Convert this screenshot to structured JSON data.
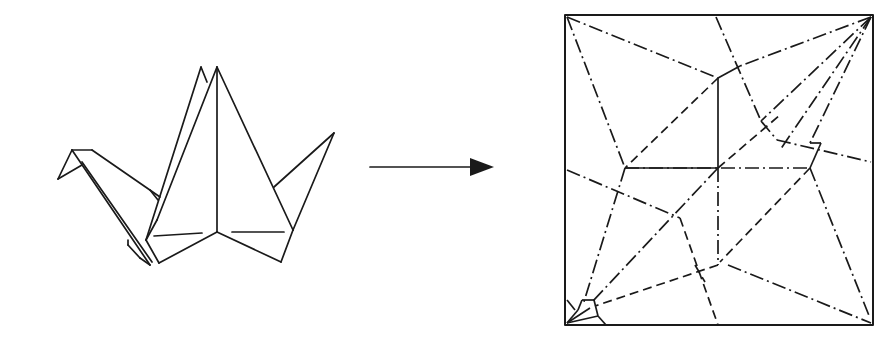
{
  "diagram": {
    "title": "Origami crane to crease pattern",
    "colors": {
      "ink": "#1a1a1a",
      "background": "#ffffff"
    },
    "crane": {
      "label": "Folded origami crane",
      "lines": [
        [
          [
            201,
            67
          ],
          [
            146,
            240
          ]
        ],
        [
          [
            201,
            67
          ],
          [
            207,
            82
          ]
        ],
        [
          [
            217,
            67
          ],
          [
            157,
            220
          ]
        ],
        [
          [
            217,
            67
          ],
          [
            217,
            232
          ]
        ],
        [
          [
            217,
            67
          ],
          [
            293,
            230
          ]
        ],
        [
          [
            217,
            232
          ],
          [
            159,
            263
          ]
        ],
        [
          [
            217,
            232
          ],
          [
            281,
            262
          ]
        ],
        [
          [
            157,
            220
          ],
          [
            146,
            240
          ]
        ],
        [
          [
            146,
            240
          ],
          [
            159,
            263
          ]
        ],
        [
          [
            281,
            262
          ],
          [
            293,
            230
          ]
        ],
        [
          [
            293,
            230
          ],
          [
            334,
            133
          ]
        ],
        [
          [
            334,
            133
          ],
          [
            274,
            187
          ]
        ],
        [
          [
            154,
            236
          ],
          [
            202,
            233
          ]
        ],
        [
          [
            232,
            232
          ],
          [
            284,
            232
          ]
        ],
        [
          [
            72,
            150
          ],
          [
            92,
            150
          ]
        ],
        [
          [
            92,
            150
          ],
          [
            160,
            197
          ]
        ],
        [
          [
            72,
            150
          ],
          [
            58,
            179
          ]
        ],
        [
          [
            58,
            179
          ],
          [
            82,
            165
          ]
        ],
        [
          [
            72,
            150
          ],
          [
            150,
            265
          ]
        ],
        [
          [
            82,
            162
          ],
          [
            152,
            262
          ]
        ],
        [
          [
            140,
            258
          ],
          [
            150,
            265
          ]
        ],
        [
          [
            128,
            240
          ],
          [
            128,
            245
          ]
        ],
        [
          [
            128,
            245
          ],
          [
            140,
            258
          ]
        ],
        [
          [
            150,
            190
          ],
          [
            158,
            200
          ]
        ]
      ]
    },
    "arrow": {
      "label": "transforms into",
      "x1": 370,
      "y1": 167,
      "x2": 470,
      "y2": 167,
      "head": [
        [
          470,
          158
        ],
        [
          494,
          167
        ],
        [
          470,
          176
        ]
      ]
    },
    "crease_pattern": {
      "label": "Crease pattern",
      "square": {
        "x": 565,
        "y": 15,
        "w": 308,
        "h": 310
      },
      "legend": {
        "valley": "dashed line",
        "mountain": "dash-dot line"
      },
      "creases": [
        {
          "type": "mountain",
          "pts": [
            [
              567,
              17
            ],
            [
              718,
              78
            ]
          ]
        },
        {
          "type": "mountain",
          "pts": [
            [
              567,
              17
            ],
            [
              625,
              168
            ]
          ]
        },
        {
          "type": "mountain",
          "pts": [
            [
              716,
              17
            ],
            [
              761,
              121
            ]
          ]
        },
        {
          "type": "mountain",
          "pts": [
            [
              761,
              121
            ],
            [
              777,
              140
            ]
          ]
        },
        {
          "type": "mountain",
          "pts": [
            [
              871,
              17
            ],
            [
              740,
              66
            ]
          ]
        },
        {
          "type": "solidc",
          "pts": [
            [
              718,
              78
            ],
            [
              740,
              66
            ]
          ]
        },
        {
          "type": "mountain",
          "pts": [
            [
              871,
              17
            ],
            [
              761,
              121
            ]
          ]
        },
        {
          "type": "mountain",
          "pts": [
            [
              871,
              17
            ],
            [
              810,
              143
            ]
          ]
        },
        {
          "type": "mountain",
          "pts": [
            [
              871,
              17
            ],
            [
              780,
              150
            ]
          ]
        },
        {
          "type": "valley",
          "pts": [
            [
              718,
              78
            ],
            [
              625,
              168
            ]
          ]
        },
        {
          "type": "solidc",
          "pts": [
            [
              718,
              78
            ],
            [
              718,
              168
            ]
          ]
        },
        {
          "type": "mountain",
          "pts": [
            [
              777,
              140
            ],
            [
              871,
              162
            ]
          ]
        },
        {
          "type": "solidc",
          "pts": [
            [
              810,
              143
            ],
            [
              821,
              143
            ]
          ]
        },
        {
          "type": "solidc",
          "pts": [
            [
              821,
              143
            ],
            [
              810,
              168
            ]
          ]
        },
        {
          "type": "mountain",
          "pts": [
            [
              625,
              168
            ],
            [
              810,
              168
            ]
          ]
        },
        {
          "type": "solidc",
          "pts": [
            [
              625,
              168
            ],
            [
              718,
              168
            ]
          ]
        },
        {
          "type": "valley",
          "pts": [
            [
              718,
              168
            ],
            [
              780,
              115
            ]
          ]
        },
        {
          "type": "mountain",
          "pts": [
            [
              567,
              170
            ],
            [
              680,
              218
            ]
          ]
        },
        {
          "type": "mountain",
          "pts": [
            [
              625,
              168
            ],
            [
              583,
              305
            ]
          ]
        },
        {
          "type": "mountain",
          "pts": [
            [
              718,
              168
            ],
            [
              592,
              302
            ]
          ]
        },
        {
          "type": "mountain",
          "pts": [
            [
              718,
              168
            ],
            [
              718,
              265
            ]
          ]
        },
        {
          "type": "valley",
          "pts": [
            [
              810,
              168
            ],
            [
              720,
              262
            ]
          ]
        },
        {
          "type": "mountain",
          "pts": [
            [
              810,
              168
            ],
            [
              870,
              318
            ]
          ]
        },
        {
          "type": "valley",
          "pts": [
            [
              680,
              218
            ],
            [
              718,
              325
            ]
          ]
        },
        {
          "type": "valley",
          "pts": [
            [
              718,
              265
            ],
            [
              595,
              306
            ]
          ]
        },
        {
          "type": "mountain",
          "pts": [
            [
              728,
              265
            ],
            [
              871,
              323
            ]
          ]
        },
        {
          "type": "valley",
          "pts": [
            [
              695,
              265
            ],
            [
              705,
              282
            ]
          ]
        },
        {
          "type": "solidc",
          "pts": [
            [
              567,
              323
            ],
            [
              578,
              310
            ]
          ]
        },
        {
          "type": "solidc",
          "pts": [
            [
              567,
              323
            ],
            [
              590,
              308
            ]
          ]
        },
        {
          "type": "solidc",
          "pts": [
            [
              567,
              323
            ],
            [
              598,
              316
            ]
          ]
        },
        {
          "type": "solidc",
          "pts": [
            [
              578,
              310
            ],
            [
              582,
              300
            ]
          ]
        },
        {
          "type": "solidc",
          "pts": [
            [
              582,
              300
            ],
            [
              594,
              300
            ]
          ]
        },
        {
          "type": "solidc",
          "pts": [
            [
              594,
              300
            ],
            [
              598,
              316
            ]
          ]
        },
        {
          "type": "solidc",
          "pts": [
            [
              598,
              316
            ],
            [
              606,
              325
            ]
          ]
        },
        {
          "type": "solidc",
          "pts": [
            [
              567,
              300
            ],
            [
              575,
              310
            ]
          ]
        }
      ]
    }
  }
}
